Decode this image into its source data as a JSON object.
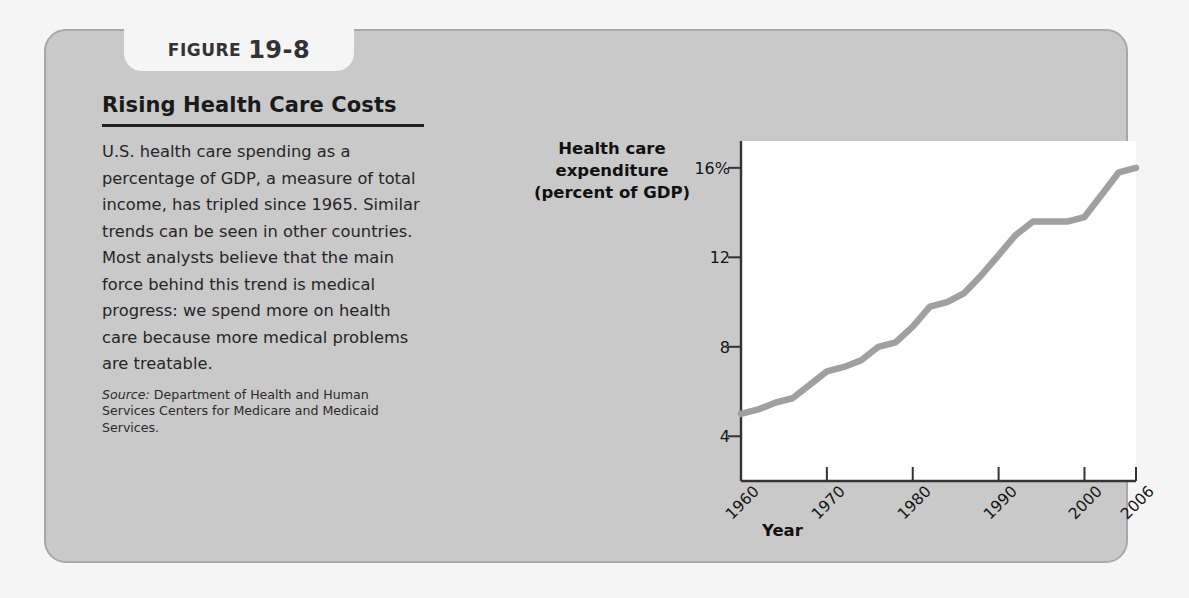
{
  "figure": {
    "tab_word": "FIGURE",
    "tab_number": "19-8",
    "title": "Rising Health Care Costs",
    "body": "U.S. health care spending as a percentage of GDP, a measure of total income, has tripled since 1965. Similar trends can be seen in other countries. Most analysts believe that the main force behind this trend is medical progress: we spend more on health care because more medical problems are treatable.",
    "source_label": "Source:",
    "source_text": " Department of Health and Human Services Centers for Medicare and Medicaid Services."
  },
  "colors": {
    "page_background": "#f5f5f5",
    "card_background": "#c9c9c9",
    "card_border": "#a8a8a8",
    "plot_background": "#ffffff",
    "axis": "#333333",
    "line": "#a0a0a0",
    "text": "#1a1a1a"
  },
  "chart_data": {
    "type": "line",
    "title": "Rising Health Care Costs",
    "ylabel": "Health care expenditure (percent of GDP)",
    "xlabel": "Year",
    "ylim": [
      2,
      17.2
    ],
    "xlim": [
      1960,
      2006
    ],
    "grid": false,
    "legend": "none",
    "ytick_labels": [
      "16%",
      "12",
      "8",
      "4"
    ],
    "ytick_values": [
      16,
      12,
      8,
      4
    ],
    "xtick_labels": [
      "1960",
      "1970",
      "1980",
      "1990",
      "2000",
      "2006"
    ],
    "xtick_values": [
      1960,
      1970,
      1980,
      1990,
      2000,
      2006
    ],
    "series": [
      {
        "name": "U.S. health care expenditure (percent of GDP)",
        "x": [
          1960,
          1962,
          1964,
          1966,
          1968,
          1970,
          1972,
          1974,
          1976,
          1978,
          1980,
          1982,
          1984,
          1986,
          1988,
          1990,
          1992,
          1994,
          1996,
          1998,
          2000,
          2002,
          2004,
          2006
        ],
        "values": [
          5.0,
          5.2,
          5.5,
          5.7,
          6.3,
          6.9,
          7.1,
          7.4,
          8.0,
          8.2,
          8.9,
          9.8,
          10.0,
          10.4,
          11.2,
          12.1,
          13.0,
          13.6,
          13.6,
          13.6,
          13.8,
          14.8,
          15.8,
          16.0
        ]
      }
    ]
  }
}
